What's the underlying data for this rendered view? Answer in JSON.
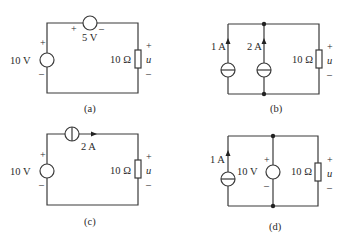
{
  "figure": {
    "panels": [
      {
        "id": "a",
        "caption": "(a)",
        "source_left": {
          "type": "voltage-source",
          "label": "10 V",
          "plus": "+",
          "minus": "–"
        },
        "source_top": {
          "type": "voltage-source",
          "label": "5 V",
          "plus": "+",
          "minus": "–"
        },
        "resistor": {
          "label": "10 Ω"
        },
        "output": {
          "label": "u",
          "plus": "+",
          "minus": "–"
        }
      },
      {
        "id": "b",
        "caption": "(b)",
        "source_1": {
          "type": "current-source",
          "label": "1 A"
        },
        "source_2": {
          "type": "current-source",
          "label": "2 A"
        },
        "resistor": {
          "label": "10 Ω"
        },
        "output": {
          "label": "u",
          "plus": "+",
          "minus": "–"
        }
      },
      {
        "id": "c",
        "caption": "(c)",
        "source_left": {
          "type": "voltage-source",
          "label": "10 V",
          "plus": "+",
          "minus": "–"
        },
        "source_top": {
          "type": "current-source",
          "label": "2 A"
        },
        "resistor": {
          "label": "10 Ω"
        },
        "output": {
          "label": "u",
          "plus": "+",
          "minus": "–"
        }
      },
      {
        "id": "d",
        "caption": "(d)",
        "source_1": {
          "type": "current-source",
          "label": "1 A"
        },
        "source_2": {
          "type": "voltage-source",
          "label": "10 V",
          "plus": "+",
          "minus": "–"
        },
        "resistor": {
          "label": "10 Ω"
        },
        "output": {
          "label": "u",
          "plus": "+",
          "minus": "–"
        }
      }
    ]
  }
}
